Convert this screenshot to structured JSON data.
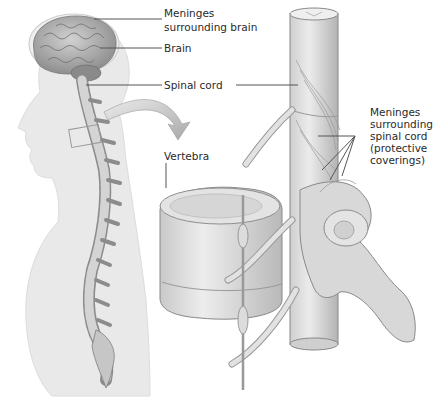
{
  "figure": {
    "labels": {
      "meninges_brain": [
        "Meninges",
        "surrounding brain"
      ],
      "brain": "Brain",
      "spinal_cord": "Spinal cord",
      "meninges_cord": [
        "Meninges",
        "surrounding",
        "spinal cord",
        "(protective",
        "coverings)"
      ],
      "vertebra": "Vertebra"
    },
    "panels": [
      {
        "name": "body-silhouette",
        "description": "Side view of human body showing brain and spinal column"
      },
      {
        "name": "vertebra-closeup",
        "description": "Enlarged view of a vertebra with spinal cord and meninges"
      }
    ],
    "colors": {
      "silhouette": "#e9e9e9",
      "bone": "#dedede",
      "bone_shadow": "#a9a9a9",
      "brain": "#b8b8b8",
      "arrow": "#b5b5b5",
      "leader_line": "#555555",
      "text": "#2a2a2a"
    }
  }
}
